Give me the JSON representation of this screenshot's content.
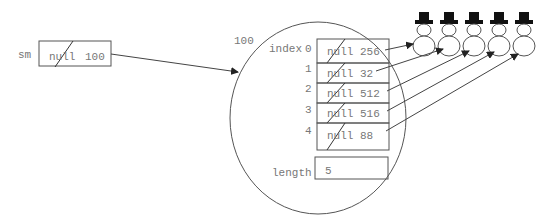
{
  "variable": {
    "name": "sm",
    "field_left": "null",
    "field_right": "100"
  },
  "object": {
    "address": "100",
    "index_label": "index",
    "rows": [
      {
        "index": "0",
        "left": "null",
        "right": "256"
      },
      {
        "index": "1",
        "left": "null",
        "right": "32"
      },
      {
        "index": "2",
        "left": "null",
        "right": "512"
      },
      {
        "index": "3",
        "left": "null",
        "right": "516"
      },
      {
        "index": "4",
        "left": "null",
        "right": "88"
      }
    ],
    "length_label": "length",
    "length_value": "5"
  },
  "snowmen": {
    "count": 5,
    "icon": "snowman-icon"
  },
  "colors": {
    "line": "#555555",
    "text": "#777777",
    "hat": "#111111"
  }
}
